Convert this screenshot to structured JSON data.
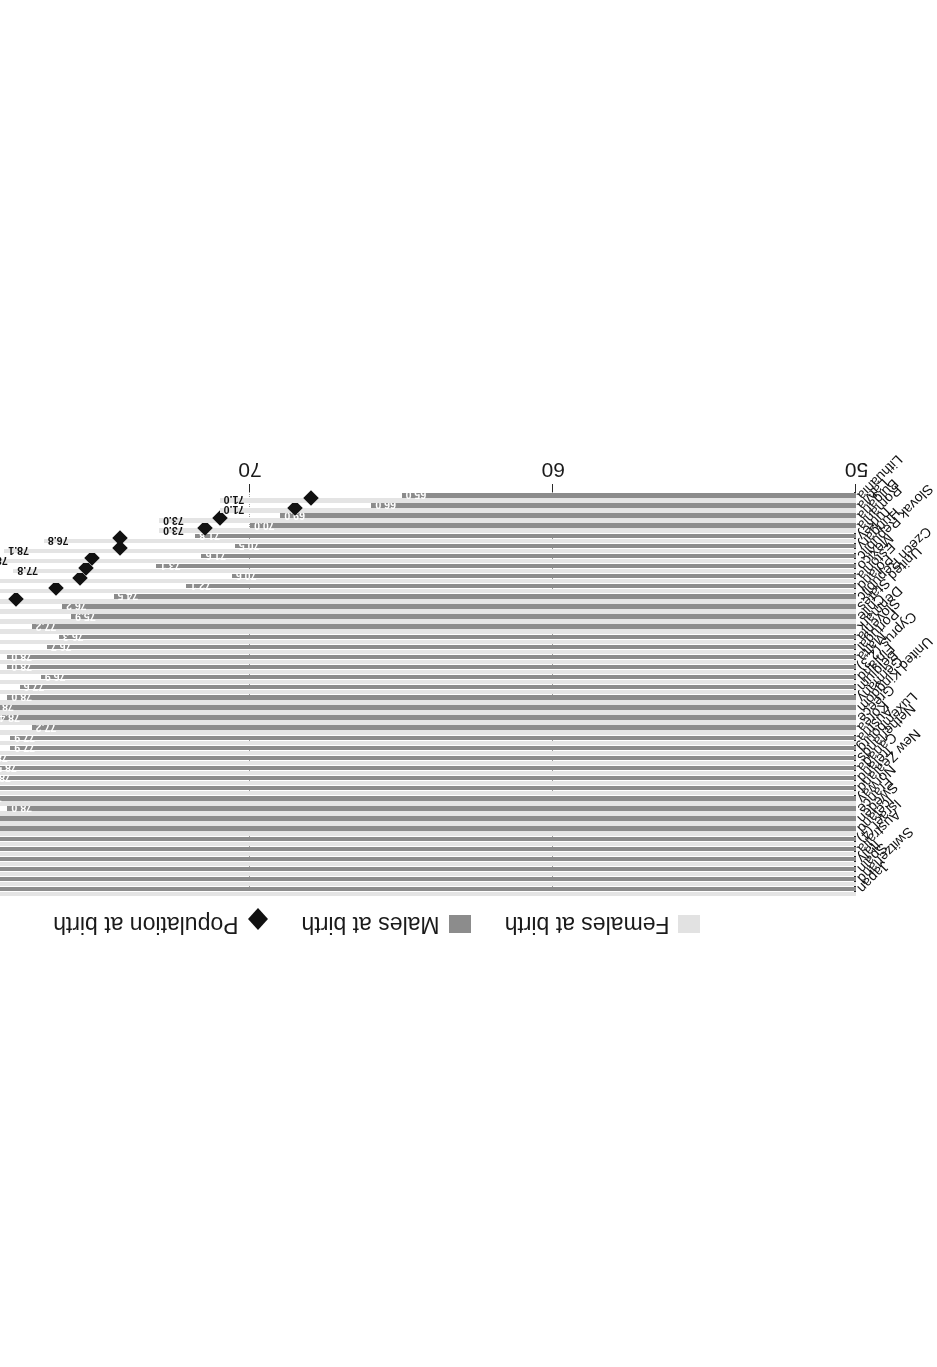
{
  "legend": {
    "items": [
      {
        "key": "females",
        "label": "Females at birth",
        "marker": "square-swatch-light",
        "color": "#e4e4e4"
      },
      {
        "key": "males",
        "label": "Males at birth",
        "marker": "square-swatch-dark",
        "color": "#8c8c8c"
      },
      {
        "key": "population",
        "label": "Population at birth",
        "marker": "diamond-marker",
        "color": "#111111"
      }
    ]
  },
  "axis": {
    "ticks": [
      "50",
      "60",
      "70",
      "80",
      "90"
    ],
    "min": 50,
    "max": 90
  },
  "chart_data": {
    "type": "bar",
    "title": "",
    "subtitle": "",
    "xlabel": "",
    "ylabel": "",
    "xlim": [
      50,
      90
    ],
    "grid": true,
    "legend_position": "top",
    "orientation": "horizontal",
    "categories": [
      "Japan",
      "Switzerland",
      "Spain",
      "Italy",
      "Australia",
      "Israel (4)",
      "Iceland",
      "Sweden",
      "France",
      "Norway",
      "New Zealand",
      "Ireland",
      "Canada",
      "Netherlands",
      "Luxembourg",
      "Austria",
      "Korea",
      "Greece",
      "United Kingdom",
      "Germany",
      "Belgium",
      "Finland",
      "Cyprus (2,3)",
      "Malta",
      "Portugal",
      "Slovenia",
      "Denmark",
      "Chile",
      "United States",
      "Czech Republic",
      "Poland",
      "Estonia",
      "Mexico",
      "Slovak Republic",
      "Hungary",
      "Turkey",
      "Romania",
      "Bulgaria",
      "Latvia",
      "Lithuania"
    ],
    "series": [
      {
        "name": "Females at birth",
        "color": "#e4e4e4",
        "values": [
          86.4,
          84.9,
          85.3,
          84.6,
          84.0,
          83.6,
          83.5,
          83.5,
          84.7,
          83.3,
          82.8,
          83.2,
          83.1,
          82.7,
          83.5,
          83.5,
          84.1,
          82.8,
          82.6,
          83.0,
          83.0,
          83.5,
          82.0,
          82.0,
          82.8,
          82.7,
          81.4,
          82.0,
          81.1,
          80.9,
          80.6,
          80.5,
          77.8,
          78.8,
          78.1,
          76.8,
          73.0,
          73.0,
          71.0,
          71.0
        ]
      },
      {
        "name": "Males at birth",
        "color": "#8c8c8c",
        "values": [
          79.6,
          80.3,
          79.1,
          79.4,
          79.5,
          79.7,
          79.5,
          79.5,
          78.0,
          79.0,
          79.1,
          78.7,
          78.5,
          78.8,
          77.9,
          77.9,
          77.2,
          78.4,
          78.6,
          78.0,
          77.6,
          76.9,
          78.0,
          78.0,
          76.7,
          76.3,
          77.2,
          75.9,
          76.2,
          74.5,
          72.1,
          70.6,
          73.1,
          71.6,
          70.5,
          71.8,
          70.0,
          69.0,
          66.0,
          65.0
        ]
      },
      {
        "name": "Population at birth",
        "color": "#111111",
        "type": "scatter",
        "marker": "diamond",
        "values": [
          83.0,
          82.6,
          82.2,
          82.0,
          81.8,
          81.7,
          81.5,
          81.5,
          81.4,
          81.2,
          81.0,
          81.0,
          80.8,
          80.8,
          80.7,
          80.7,
          80.7,
          80.6,
          80.6,
          80.5,
          80.3,
          80.2,
          80.0,
          80.0,
          79.8,
          79.5,
          79.3,
          79.0,
          78.7,
          77.7,
          76.4,
          75.6,
          75.4,
          75.2,
          74.3,
          74.3,
          71.5,
          71.0,
          68.5,
          68.0
        ]
      }
    ]
  }
}
